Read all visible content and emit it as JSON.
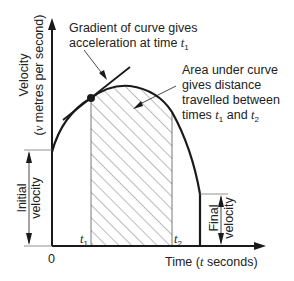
{
  "diagram": {
    "y_axis": {
      "label_line1": "Velocity",
      "label_line2_pre": "(",
      "label_line2_var": "v",
      "label_line2_post": " metres per second)"
    },
    "x_axis": {
      "label_pre": "Time (",
      "label_var": "t",
      "label_post": " seconds)",
      "origin": "0"
    },
    "annotations": {
      "gradient": {
        "line1": "Gradient of curve gives",
        "line2_pre": "acceleration at time ",
        "var": "t",
        "sub": "1"
      },
      "area": {
        "line1": "Area under curve",
        "line2": "gives distance",
        "line3": "travelled between",
        "line4_pre": "times ",
        "var1": "t",
        "sub1": "1",
        "mid": " and ",
        "var2": "t",
        "sub2": "2"
      }
    },
    "markers": {
      "t1": {
        "var": "t",
        "sub": "1"
      },
      "t2": {
        "var": "t",
        "sub": "2"
      }
    },
    "brackets": {
      "initial": {
        "line1": "Initial",
        "line2": "velocity"
      },
      "final": {
        "line1": "Final",
        "line2": "velocity"
      }
    },
    "colors": {
      "ink": "#1a1a1a",
      "hatch": "#555555",
      "background": "#ffffff"
    }
  }
}
